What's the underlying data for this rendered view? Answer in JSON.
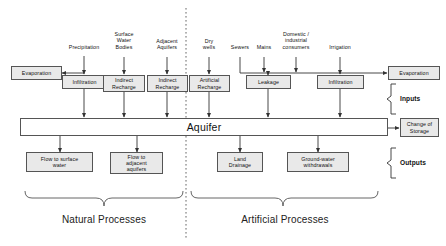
{
  "diagram": {
    "colors": {
      "box_fill": "#e9e9e9",
      "box_stroke": "#555555",
      "line": "#333333",
      "divider": "#666666",
      "text": "#111111",
      "background": "#ffffff"
    },
    "aquifer": {
      "label": "Aquifer"
    },
    "divider": {
      "style": "dotted-vertical"
    },
    "source_labels": [
      {
        "id": "precipitation",
        "text": "Precipitation"
      },
      {
        "id": "surface-water-bodies",
        "text": "Surface\nWater\nBodies"
      },
      {
        "id": "adjacent-aquifers",
        "text": "Adjacent\nAquifers"
      },
      {
        "id": "dry-wells",
        "text": "Dry\nwells"
      },
      {
        "id": "sewers",
        "text": "Sewers"
      },
      {
        "id": "mains",
        "text": "Mains"
      },
      {
        "id": "domestic-industrial",
        "text": "Domestic /\nindustrial\nconsumers"
      },
      {
        "id": "irrigation",
        "text": "Irrigation"
      }
    ],
    "input_boxes": [
      {
        "id": "evaporation-natural",
        "text": "Evaporation"
      },
      {
        "id": "infiltration-natural",
        "text": "Infiltration"
      },
      {
        "id": "indirect-recharge-surface",
        "text": "Indirect\nRecharge"
      },
      {
        "id": "indirect-recharge-adjacent",
        "text": "Indirect\nRecharge"
      },
      {
        "id": "artificial-recharge",
        "text": "Artificial\nRecharge"
      },
      {
        "id": "leakage",
        "text": "Leakage"
      },
      {
        "id": "infiltration-artificial",
        "text": "Infiltration"
      },
      {
        "id": "evaporation-artificial",
        "text": "Evaporation"
      }
    ],
    "output_boxes": [
      {
        "id": "flow-to-surface-water",
        "text": "Flow to surface\nwater"
      },
      {
        "id": "flow-to-adjacent-aquifers",
        "text": "Flow to\nadjacent\naquifers"
      },
      {
        "id": "land-drainage",
        "text": "Land\nDrainage"
      },
      {
        "id": "groundwater-withdrawals",
        "text": "Ground-water\nwithdrawals"
      }
    ],
    "storage_box": {
      "text": "Change of\nStorage"
    },
    "side_labels": [
      {
        "id": "inputs",
        "text": "Inputs"
      },
      {
        "id": "outputs",
        "text": "Outputs"
      }
    ],
    "group_captions": [
      {
        "id": "natural-processes",
        "text": "Natural Processes"
      },
      {
        "id": "artificial-processes",
        "text": "Artificial Processes"
      }
    ]
  }
}
